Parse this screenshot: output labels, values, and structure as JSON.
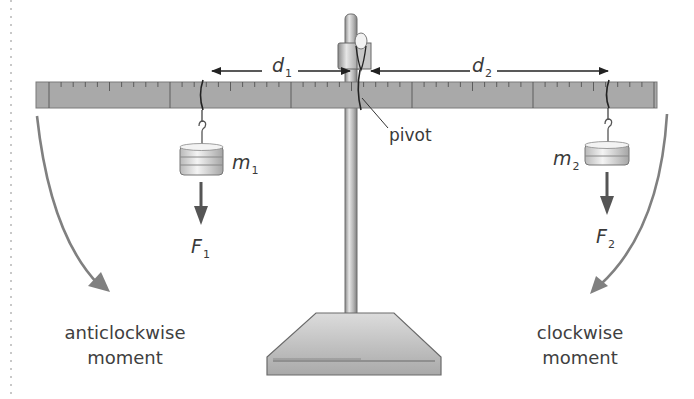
{
  "diagram": {
    "labels": {
      "d1": {
        "symbol": "d",
        "sub": "1"
      },
      "d2": {
        "symbol": "d",
        "sub": "2"
      },
      "m1": {
        "symbol": "m",
        "sub": "1"
      },
      "m2": {
        "symbol": "m",
        "sub": "2"
      },
      "F1": {
        "symbol": "F",
        "sub": "1"
      },
      "F2": {
        "symbol": "F",
        "sub": "2"
      },
      "pivot": "pivot",
      "anticlockwise_line1": "anticlockwise",
      "anticlockwise_line2": "moment",
      "clockwise_line1": "clockwise",
      "clockwise_line2": "moment"
    },
    "colors": {
      "ruler_fill": "#a9a9a9",
      "ruler_edge": "#7a7a7a",
      "moment_arrow": "#808080",
      "force_arrow": "#555555",
      "line_dark": "#222222",
      "metal_light": "#ececec",
      "metal_dark": "#9a9a9a",
      "text": "#3a3a3a"
    }
  }
}
